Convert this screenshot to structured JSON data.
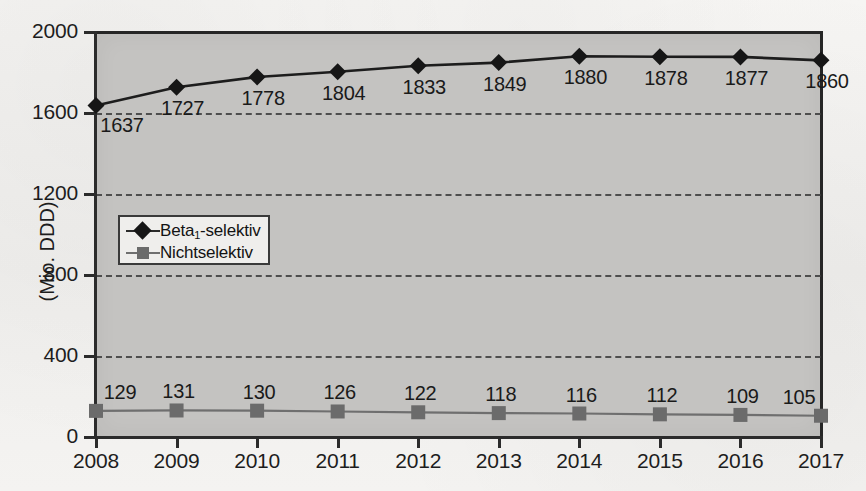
{
  "chart_data": {
    "type": "line",
    "title": "",
    "xlabel": "",
    "ylabel": "(Mio. DDD)",
    "categories": [
      "2008",
      "2009",
      "2010",
      "2011",
      "2012",
      "2013",
      "2014",
      "2015",
      "2016",
      "2017"
    ],
    "ylim": [
      0,
      2000
    ],
    "yticks": [
      0,
      400,
      800,
      1200,
      1600,
      2000
    ],
    "ytick_labels": [
      "0",
      "400",
      "800",
      "1200",
      "1600",
      "2000"
    ],
    "grid": true,
    "legend_position": "inside-left",
    "series": [
      {
        "name": "Beta₁-selektiv",
        "name_prefix": "Beta",
        "name_subscript": "1",
        "name_suffix": "-selektiv",
        "marker": "diamond",
        "color": "#161616",
        "values": [
          1637,
          1727,
          1778,
          1804,
          1833,
          1849,
          1880,
          1878,
          1877,
          1860
        ],
        "labels": [
          "1637",
          "1727",
          "1778",
          "1804",
          "1833",
          "1849",
          "1880",
          "1878",
          "1877",
          "1860"
        ]
      },
      {
        "name": "Nichtselektiv",
        "marker": "square",
        "color": "#6b6b6b",
        "values": [
          129,
          131,
          130,
          126,
          122,
          118,
          116,
          112,
          109,
          105
        ],
        "labels": [
          "129",
          "131",
          "130",
          "126",
          "122",
          "118",
          "116",
          "112",
          "109",
          "105"
        ]
      }
    ]
  },
  "colors": {
    "plot_background": "#c4c3c1",
    "page_background": "#f3f2f0",
    "axis": "#2b2b2b",
    "series1": "#161616",
    "series2": "#6b6b6b"
  }
}
